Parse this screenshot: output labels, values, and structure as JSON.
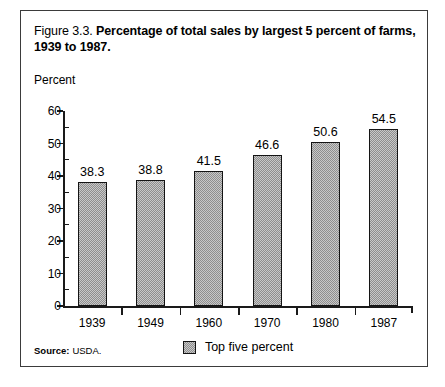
{
  "figure": {
    "number": "Figure 3.3.",
    "caption": "Percentage of total sales by largest 5 percent of farms, 1939 to 1987.",
    "source_label": "Source:",
    "source_value": "USDA."
  },
  "chart_data": {
    "type": "bar",
    "title": "Percentage of total sales by largest 5 percent of farms, 1939 to 1987.",
    "xlabel": "",
    "ylabel": "Percent",
    "categories": [
      "1939",
      "1949",
      "1960",
      "1970",
      "1980",
      "1987"
    ],
    "values": [
      38.3,
      38.8,
      41.5,
      46.6,
      50.6,
      54.5
    ],
    "value_labels": [
      "38.3",
      "38.8",
      "41.5",
      "46.6",
      "50.6",
      "54.5"
    ],
    "series": [
      {
        "name": "Top five percent",
        "values": [
          38.3,
          38.8,
          41.5,
          46.6,
          50.6,
          54.5
        ]
      }
    ],
    "ylim": [
      0,
      60
    ],
    "yticks": [
      0,
      10,
      20,
      30,
      40,
      50,
      60
    ],
    "ytick_labels": [
      "0",
      "10",
      "20",
      "30",
      "40",
      "50",
      "60"
    ],
    "y_minor_tick_interval": 5,
    "grid": false,
    "legend": {
      "position": "bottom-center",
      "entries": [
        "Top five percent"
      ]
    },
    "bar_fill": "#c8c8c8",
    "bar_edge": "#141414"
  }
}
